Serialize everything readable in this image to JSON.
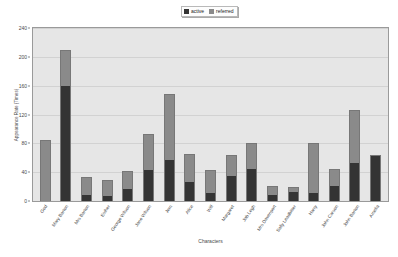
{
  "chart_data": {
    "type": "bar",
    "title": "",
    "subtitle": "",
    "xlabel": "Characters",
    "ylabel": "Appearance Rate (Times)",
    "ylim": [
      0,
      240
    ],
    "yticks": [
      0,
      40,
      80,
      120,
      160,
      200,
      240
    ],
    "grid": true,
    "stacked": true,
    "legend_position": "top-center",
    "legend": [
      "active",
      "referred"
    ],
    "categories": [
      "God",
      "Mary Barton",
      "Mrs Barton",
      "Esther",
      "George Wilson",
      "Jane Wilson",
      "Jem",
      "Alice",
      "Will",
      "Margaret",
      "Job Legh",
      "Mrs Davenport",
      "Sally Leadbitter",
      "Harry",
      "John Carson",
      "John Barton",
      "Amelia"
    ],
    "series": [
      {
        "name": "active",
        "color": "#343434",
        "values": [
          0,
          160,
          8,
          8,
          17,
          43,
          58,
          27,
          12,
          35,
          45,
          9,
          13,
          11,
          22,
          54,
          64
        ]
      },
      {
        "name": "referred",
        "color": "#8a8a8a",
        "values": [
          85,
          50,
          25,
          21,
          25,
          50,
          90,
          38,
          31,
          29,
          35,
          12,
          7,
          69,
          23,
          72,
          0
        ]
      }
    ],
    "totals": [
      85,
      210,
      33,
      29,
      42,
      93,
      148,
      65,
      43,
      64,
      80,
      21,
      20,
      80,
      45,
      126,
      64
    ]
  },
  "legend": {
    "entries": [
      {
        "label": "active",
        "color": "#343434"
      },
      {
        "label": "referred",
        "color": "#8a8a8a"
      }
    ]
  },
  "axes": {
    "y_title": "Appearance Rate (Times)",
    "x_title": "Characters",
    "y_ticks": [
      "240",
      "200",
      "160",
      "120",
      "80",
      "40",
      "0"
    ]
  },
  "colors": {
    "active": "#343434",
    "referred": "#8a8a8a",
    "plot_background": "#e6e6e6",
    "gridline": "#d2d2d2",
    "axis_text": "#4a4a4a",
    "page_background": "#ffffff"
  }
}
